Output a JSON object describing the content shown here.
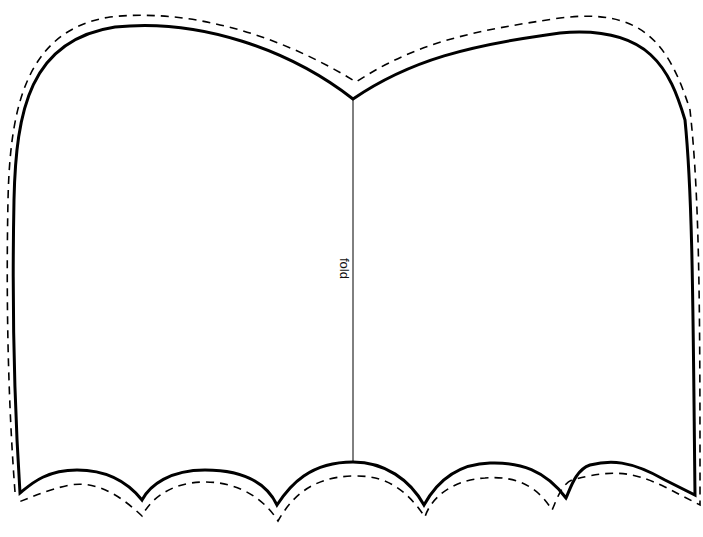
{
  "template": {
    "fold_label": "fold",
    "colors": {
      "line": "#000000",
      "background": "#ffffff"
    }
  }
}
